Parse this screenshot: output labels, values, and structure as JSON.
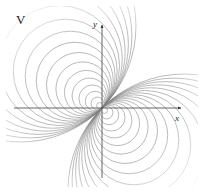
{
  "figure": {
    "label": "V",
    "caption": "",
    "background_color": "#ffffff"
  },
  "axes": {
    "x_label": "x",
    "y_label": "y",
    "axis_color": "#555555",
    "origin_px": [
      102,
      108
    ],
    "x_axis_from_px": [
      14,
      108
    ],
    "x_axis_to_px": [
      185,
      108
    ],
    "y_axis_from_px": [
      102,
      178
    ],
    "y_axis_to_px": [
      102,
      22
    ]
  },
  "chart_data": {
    "type": "line",
    "title": "V",
    "subtitle": "",
    "xlabel": "x",
    "ylabel": "y",
    "legend": [],
    "grid": false,
    "annotations": [
      "V"
    ],
    "contour_color": "#808080",
    "contour_line_width": 0.55,
    "origin_singularity": true,
    "tangent_direction_deg": 135,
    "lobes": [
      {
        "name": "upper-left-lobe",
        "center_px": [
          82,
          84
        ],
        "sign": "+",
        "circle_count": 17,
        "tangent_point_px": [
          102,
          108
        ],
        "radii_px": [
          3.2,
          6.4,
          9.8,
          13.5,
          17.5,
          22.0,
          27.0,
          32.5,
          38.5,
          45.0,
          52.0,
          60.0,
          69.0,
          79.0,
          90.0,
          102.0,
          116.0
        ]
      },
      {
        "name": "lower-right-lobe",
        "center_px": [
          122,
          132
        ],
        "sign": "-",
        "circle_count": 17,
        "tangent_point_px": [
          102,
          108
        ],
        "radii_px": [
          3.2,
          6.4,
          9.8,
          13.5,
          17.5,
          22.0,
          27.0,
          32.5,
          38.5,
          45.0,
          52.0,
          60.0,
          69.0,
          79.0,
          90.0,
          102.0,
          116.0
        ]
      }
    ],
    "contour_levels_relative": [
      1.0,
      0.78,
      0.6,
      0.46,
      0.35,
      0.27,
      0.2,
      0.15,
      0.11,
      0.085,
      0.063,
      0.047,
      0.034,
      0.025,
      0.018,
      0.013,
      0.009
    ],
    "xlim": [
      -2.2,
      2.2
    ],
    "ylim": [
      -2.2,
      2.2
    ]
  }
}
